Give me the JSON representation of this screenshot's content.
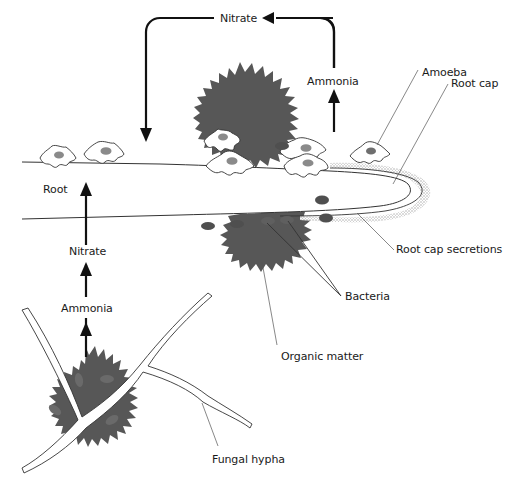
{
  "diagram": {
    "type": "biological-process",
    "colors": {
      "organic_matter": "#575757",
      "bacteria": "#4f4f4f",
      "amoeba_nucleus": "#8a8a8a",
      "outline": "#333333",
      "arrow": "#111111",
      "secretion_stipple": "#b5b5b5",
      "background": "#ffffff"
    },
    "labels": {
      "nitrate_top": "Nitrate",
      "ammonia_top": "Ammonia",
      "amoeba": "Amoeba",
      "root_cap": "Root cap",
      "root": "Root",
      "nitrate_left": "Nitrate",
      "ammonia_left": "Ammonia",
      "root_cap_secretions": "Root cap secretions",
      "bacteria": "Bacteria",
      "organic_matter": "Organic matter",
      "fungal_hypha": "Fungal hypha"
    },
    "flows": [
      {
        "from": "Ammonia",
        "to": "Nitrate",
        "location": "above root"
      },
      {
        "from": "Nitrate",
        "to": "Root",
        "location": "top loop"
      },
      {
        "from": "Organic matter",
        "to": "Ammonia",
        "location": "lower left"
      },
      {
        "from": "Ammonia",
        "to": "Nitrate",
        "location": "lower left"
      },
      {
        "from": "Nitrate",
        "to": "Root",
        "location": "lower left"
      }
    ]
  }
}
